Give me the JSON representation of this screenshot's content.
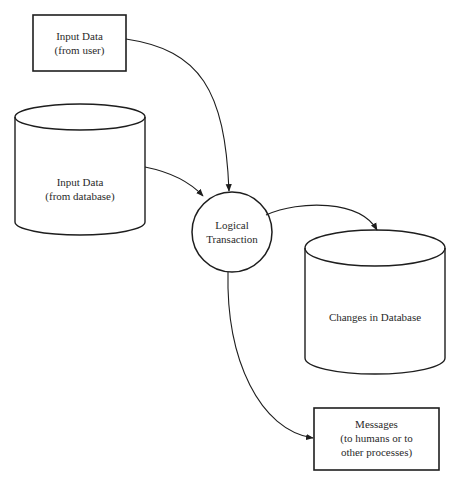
{
  "diagram": {
    "nodes": [
      {
        "id": "input_user",
        "shape": "rectangle",
        "lines": [
          "Input Data",
          "(from user)"
        ]
      },
      {
        "id": "input_db",
        "shape": "cylinder",
        "lines": [
          "Input Data",
          "(from database)"
        ]
      },
      {
        "id": "transaction",
        "shape": "circle",
        "lines": [
          "Logical",
          "Transaction"
        ]
      },
      {
        "id": "changes_db",
        "shape": "cylinder",
        "lines": [
          "Changes in Database"
        ]
      },
      {
        "id": "messages",
        "shape": "rectangle",
        "lines": [
          "Messages",
          "(to humans or to",
          "other processes)"
        ]
      }
    ],
    "edges": [
      {
        "from": "input_user",
        "to": "transaction"
      },
      {
        "from": "input_db",
        "to": "transaction"
      },
      {
        "from": "transaction",
        "to": "changes_db"
      },
      {
        "from": "transaction",
        "to": "messages"
      }
    ]
  },
  "colors": {
    "stroke": "#1e1e1e",
    "text": "#2a2a2a",
    "background": "#ffffff"
  }
}
